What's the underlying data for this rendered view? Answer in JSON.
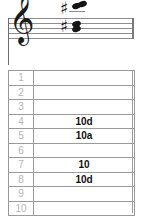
{
  "notation": {
    "clef_glyph": "𝄞",
    "clef_name": "treble-clef",
    "sharp_glyph": "♯",
    "upper_chord": {
      "accidental": "♯",
      "note_count": 2
    },
    "lower_chord": {
      "accidental": "♯",
      "note_count": 2
    }
  },
  "tab": {
    "rows": [
      {
        "number": "1",
        "value": ""
      },
      {
        "number": "2",
        "value": ""
      },
      {
        "number": "3",
        "value": ""
      },
      {
        "number": "4",
        "value": "10d"
      },
      {
        "number": "5",
        "value": "10a"
      },
      {
        "number": "6",
        "value": ""
      },
      {
        "number": "7",
        "value": "10"
      },
      {
        "number": "8",
        "value": "10d"
      },
      {
        "number": "9",
        "value": ""
      },
      {
        "number": "10",
        "value": ""
      }
    ]
  },
  "colors": {
    "grid": "#9a9a9a",
    "row_number": "#b4b4b4",
    "value_text": "#111111",
    "staff_line": "#8d8d8d"
  }
}
